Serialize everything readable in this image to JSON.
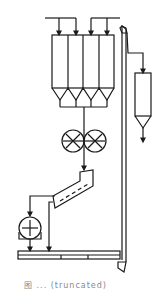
{
  "diagram": {
    "type": "process-flow",
    "line_color": "#1a1a1a",
    "components": [
      {
        "id": "feed-header",
        "label": "feed lines (2 branches, 4 arrows)"
      },
      {
        "id": "silos",
        "label": "4 storage silos with conical hoppers",
        "count": 4
      },
      {
        "id": "roller-crusher",
        "label": "double roller mill"
      },
      {
        "id": "inclined-feeder",
        "label": "inclined vibrating feeder"
      },
      {
        "id": "motor",
        "label": "motor / weigher"
      },
      {
        "id": "belt-conveyor",
        "label": "horizontal belt conveyor"
      },
      {
        "id": "bucket-elevator",
        "label": "bucket elevator"
      },
      {
        "id": "receiving-bin",
        "label": "receiving bin with discharge"
      }
    ],
    "caption": "图 ... (truncated)"
  }
}
